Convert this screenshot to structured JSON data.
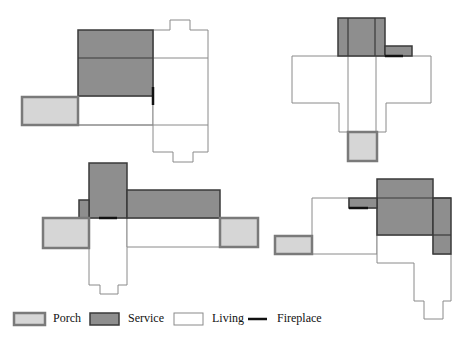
{
  "colors": {
    "porch_fill": "#d6d6d6",
    "porch_stroke": "#7a7a7a",
    "service_fill": "#8e8e8e",
    "service_stroke": "#3a3a3a",
    "living_fill": "#ffffff",
    "living_stroke": "#8a8a8a",
    "fireplace": "#111111"
  },
  "plans": [
    {
      "name": "plan-top-left",
      "service": [
        [
          78,
          30,
          75,
          66
        ]
      ],
      "service_lines": [
        [
          78,
          58,
          153,
          58
        ]
      ],
      "porch": [
        [
          22,
          97,
          56,
          28
        ]
      ],
      "living_polys": [
        "78,96 153,96 153,125 78,125",
        "153,30 170,30 170,20 190,20 190,30 208,30 208,152 193,152 193,162 173,162 173,152 153,152 153,30"
      ],
      "living_lines": [
        [
          153,
          58,
          208,
          58
        ],
        [
          153,
          125,
          208,
          125
        ],
        [
          78,
          125,
          153,
          125
        ]
      ],
      "fireplace": [
        [
          153,
          87,
          153,
          105
        ]
      ]
    },
    {
      "name": "plan-top-right",
      "service": [
        [
          338,
          18,
          47,
          38
        ],
        [
          385,
          46,
          27,
          10
        ]
      ],
      "service_lines": [
        [
          348,
          18,
          348,
          56
        ],
        [
          375,
          18,
          375,
          56
        ]
      ],
      "porch": [
        [
          348,
          132,
          29,
          29
        ]
      ],
      "living_polys": [
        "292,56 431,56 431,103 386,103 386,132 339,132 339,103 292,103 292,56"
      ],
      "living_lines": [
        [
          348,
          56,
          348,
          132
        ],
        [
          376,
          56,
          376,
          132
        ]
      ],
      "fireplace": [
        [
          385,
          56,
          403,
          56
        ]
      ]
    },
    {
      "name": "plan-bottom-left",
      "service": [
        [
          89,
          163,
          38,
          55
        ],
        [
          79,
          200,
          10,
          18
        ],
        [
          127,
          190,
          93,
          28
        ]
      ],
      "service_lines": [],
      "porch": [
        [
          43,
          218,
          46,
          30
        ],
        [
          220,
          218,
          38,
          29
        ]
      ],
      "living_polys": [
        "89,218 127,218 127,285 118,285 118,294 100,294 100,285 89,285 89,218",
        "127,218 220,218 220,247 127,247"
      ],
      "living_lines": [],
      "fireplace": [
        [
          99,
          218,
          117,
          218
        ]
      ]
    },
    {
      "name": "plan-bottom-right",
      "service": [
        [
          377,
          179,
          56,
          56
        ],
        [
          433,
          198,
          18,
          56
        ],
        [
          349,
          198,
          28,
          10
        ]
      ],
      "service_lines": [
        [
          377,
          198,
          451,
          198
        ],
        [
          433,
          235,
          451,
          235
        ]
      ],
      "porch": [
        [
          275,
          236,
          37,
          18
        ]
      ],
      "living_polys": [
        "312,198 349,198 349,208 377,208 377,254 312,254 312,198",
        "377,235 433,235 433,254 451,254 451,301 443,301 443,319 424,319 424,301 414,301 414,263 377,263 377,235"
      ],
      "living_lines": [],
      "fireplace": [
        [
          349,
          208,
          368,
          208
        ]
      ]
    }
  ],
  "legend": {
    "items": [
      {
        "label": "Porch",
        "type": "porch",
        "swatch": [
          14,
          313,
          31,
          12
        ],
        "label_x": 53
      },
      {
        "label": "Service",
        "type": "service",
        "swatch": [
          90,
          313,
          29,
          12
        ],
        "label_x": 128
      },
      {
        "label": "Living",
        "type": "living",
        "swatch": [
          174,
          313,
          29,
          12
        ],
        "label_x": 212
      },
      {
        "label": "Fireplace",
        "type": "fireplace",
        "swatch": [
          248,
          319,
          19,
          0
        ],
        "label_x": 277
      }
    ]
  }
}
